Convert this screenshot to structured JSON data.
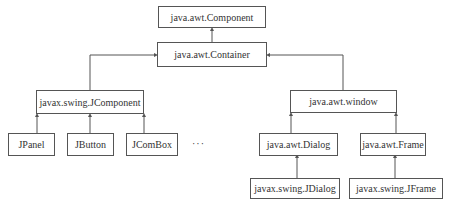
{
  "diagram": {
    "type": "class-hierarchy",
    "nodes": {
      "component": {
        "label": "java.awt.Component"
      },
      "container": {
        "label": "java.awt.Container"
      },
      "jcomponent": {
        "label": "javax.swing.JComponent"
      },
      "window": {
        "label": "java.awt.window"
      },
      "jpanel": {
        "label": "JPanel"
      },
      "jbutton": {
        "label": "JButton"
      },
      "jcombox": {
        "label": "JComBox"
      },
      "ellipsis": {
        "label": "···"
      },
      "dialog": {
        "label": "java.awt.Dialog"
      },
      "frame": {
        "label": "java.awt.Frame"
      },
      "jdialog": {
        "label": "javax.swing.JDialog"
      },
      "jframe": {
        "label": "javax.swing.JFrame"
      }
    },
    "edges": [
      {
        "from": "java.awt.Container",
        "to": "java.awt.Component"
      },
      {
        "from": "javax.swing.JComponent",
        "to": "java.awt.Container"
      },
      {
        "from": "java.awt.window",
        "to": "java.awt.Container"
      },
      {
        "from": "JPanel",
        "to": "javax.swing.JComponent"
      },
      {
        "from": "JButton",
        "to": "javax.swing.JComponent"
      },
      {
        "from": "JComBox",
        "to": "javax.swing.JComponent"
      },
      {
        "from": "java.awt.Dialog",
        "to": "java.awt.window"
      },
      {
        "from": "java.awt.Frame",
        "to": "java.awt.window"
      },
      {
        "from": "javax.swing.JDialog",
        "to": "java.awt.Dialog"
      },
      {
        "from": "javax.swing.JFrame",
        "to": "java.awt.Frame"
      }
    ],
    "colors": {
      "line": "#555555",
      "text": "#333333",
      "background": "#ffffff"
    }
  }
}
